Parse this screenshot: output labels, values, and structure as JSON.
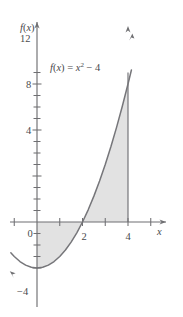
{
  "figure": {
    "title": "",
    "equation_label": "f(x) = x² − 4",
    "equation_parts": {
      "fx": "f",
      "paren_open": "(",
      "var": "x",
      "paren_close": ")",
      "equals": "=",
      "x": "x",
      "exponent": "2",
      "minus_four": "− 4"
    },
    "y_axis_title": "f(x)",
    "x_axis_title": "x",
    "origin_label": "0",
    "colors": {
      "axis": "#6f6f72",
      "curve": "#76767a",
      "shade": "#e2e2e2",
      "text": "#4a4a4d",
      "background": "#ffffff"
    }
  },
  "chart_data": {
    "type": "line",
    "title": "",
    "subtitle": "",
    "xlabel": "x",
    "ylabel": "f(x)",
    "annotations": [
      {
        "text": "f(x) = x² − 4",
        "x": 1.1,
        "y": 10.4
      }
    ],
    "grid": false,
    "legend": "none",
    "xlim": [
      -1.2,
      5.8
    ],
    "ylim": [
      -5.2,
      14.2
    ],
    "x_ticks_major": [
      0,
      2,
      4
    ],
    "x_tick_labels": [
      "0",
      "2",
      "4"
    ],
    "x_ticks_minor": [
      -1,
      1,
      3,
      5
    ],
    "y_ticks_major": [
      4,
      8,
      12
    ],
    "y_tick_labels": [
      "4",
      "8",
      "12"
    ],
    "y_ticks_minor": [
      -4,
      -3,
      -2,
      -1,
      1,
      2,
      3,
      5,
      6,
      7,
      9,
      10,
      11,
      13
    ],
    "y_label_minus_four": "−4",
    "series": [
      {
        "name": "f(x) = x^2 - 4",
        "type": "parabola",
        "expression": "x^2 - 4",
        "vertex": [
          0,
          -4
        ],
        "roots": [
          -2,
          2
        ],
        "x_start": -1.15,
        "x_end": 4.15,
        "points": [
          [
            -1.15,
            -2.68
          ],
          [
            -1.0,
            -3.0
          ],
          [
            -0.75,
            -3.44
          ],
          [
            -0.5,
            -3.75
          ],
          [
            -0.25,
            -3.94
          ],
          [
            0.0,
            -4.0
          ],
          [
            0.25,
            -3.94
          ],
          [
            0.5,
            -3.75
          ],
          [
            0.75,
            -3.44
          ],
          [
            1.0,
            -3.0
          ],
          [
            1.25,
            -2.44
          ],
          [
            1.5,
            -1.75
          ],
          [
            1.75,
            -0.94
          ],
          [
            2.0,
            0.0
          ],
          [
            2.25,
            1.06
          ],
          [
            2.5,
            2.25
          ],
          [
            2.75,
            3.56
          ],
          [
            3.0,
            5.0
          ],
          [
            3.25,
            6.56
          ],
          [
            3.5,
            8.25
          ],
          [
            3.75,
            10.06
          ],
          [
            4.0,
            12.0
          ],
          [
            4.15,
            13.22
          ]
        ]
      }
    ],
    "shaded_regions": [
      {
        "name": "area-between-curve-and-x-axis",
        "x_from": 0,
        "x_to": 4,
        "fill": "#e2e2e2",
        "description": "Region bounded by f(x)=x^2-4, the x-axis, x=0 and x=4"
      }
    ],
    "vertical_boundary": {
      "x": 4,
      "y_from": 0,
      "y_to": 12
    },
    "arrows": [
      {
        "name": "x-axis-arrow",
        "at": [
          5.75,
          0
        ],
        "direction": "right"
      },
      {
        "name": "y-axis-arrow",
        "at": [
          0,
          14.1
        ],
        "direction": "up"
      },
      {
        "name": "curve-left-arrow",
        "at": [
          -1.15,
          -2.68
        ],
        "direction": "up-left"
      },
      {
        "name": "curve-right-arrow",
        "at": [
          4.15,
          13.2
        ],
        "direction": "up-right"
      }
    ]
  }
}
